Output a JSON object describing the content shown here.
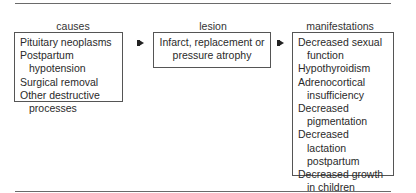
{
  "diagram": {
    "columns": [
      {
        "title": "causes",
        "items": [
          "Pituitary neoplasms",
          "Postpartum hypotension",
          "Surgical removal",
          "Other destructive processes"
        ]
      },
      {
        "title": "lesion",
        "items": [
          "Infarct, replacement or pressure atrophy"
        ]
      },
      {
        "title": "manifestations",
        "items": [
          "Decreased sexual function",
          "Hypothyroidism",
          "Adrenocortical insufficiency",
          "Decreased pigmentation",
          "Decreased lactation postpartum",
          "Decreased growth in children"
        ]
      }
    ],
    "arrows": [
      "causes-to-lesion",
      "lesion-to-manifestations"
    ]
  }
}
